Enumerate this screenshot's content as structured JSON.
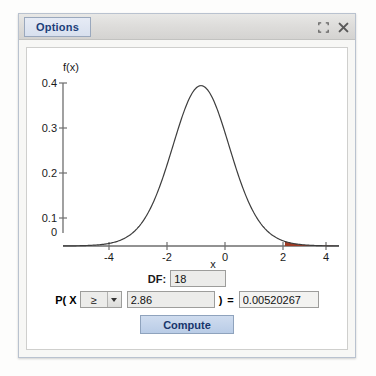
{
  "window": {
    "tab_label": "Options",
    "maximize_icon": "maximize-icon",
    "close_icon": "close-icon"
  },
  "chart_data": {
    "type": "line",
    "title": "",
    "xlabel": "x",
    "ylabel": "f(x)",
    "xlim": [
      -4.7,
      4.7
    ],
    "ylim": [
      0,
      0.4
    ],
    "xticks": [
      "-4",
      "-2",
      "0",
      "2",
      "4"
    ],
    "xtick_values": [
      -4,
      -2,
      0,
      2,
      4
    ],
    "yticks": [
      "0",
      "0.1",
      "0.2",
      "0.3",
      "0.4"
    ],
    "ytick_values": [
      0,
      0.1,
      0.2,
      0.3,
      0.4
    ],
    "grid": false,
    "legend": "none",
    "curve": "t-distribution density, df = 18",
    "peak_value": 0.394,
    "shaded_region": {
      "from": 2.86,
      "to": 4.7,
      "color": "#9e3b24",
      "area": 0.00520267
    },
    "curve_color": "#3d3d3d"
  },
  "controls": {
    "df_label": "DF:",
    "df_value": "18",
    "prob_prefix": "P( X",
    "operator": "≥",
    "operator_options": [
      "≤",
      "≥",
      "=",
      "<",
      ">"
    ],
    "x_value": "2.86",
    "close_paren": ")",
    "equals": "=",
    "result": "0.00520267",
    "compute_label": "Compute"
  }
}
